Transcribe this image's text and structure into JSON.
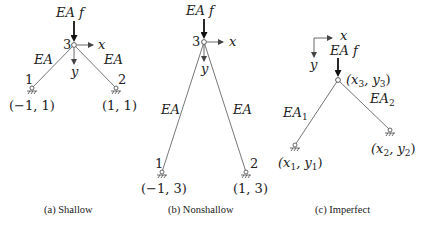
{
  "figure": {
    "panels": [
      {
        "id": "a",
        "caption": "(a) Shallow",
        "load_label": "EA f",
        "free_node_label": "3",
        "axis_x_label": "x",
        "axis_y_label": "y",
        "bar_left_label": "EA",
        "bar_right_label": "EA",
        "node_left_label": "1",
        "node_right_label": "2",
        "node_left_coord": "(−1, 1)",
        "node_right_coord": "(1, 1)"
      },
      {
        "id": "b",
        "caption": "(b) Nonshallow",
        "load_label": "EA f",
        "free_node_label": "3",
        "axis_x_label": "x",
        "axis_y_label": "y",
        "bar_left_label": "EA",
        "bar_right_label": "EA",
        "node_left_label": "1",
        "node_right_label": "2",
        "node_left_coord": "(−1, 3)",
        "node_right_coord": "(1, 3)"
      },
      {
        "id": "c",
        "caption": "(c) Imperfect",
        "load_label": "EA f",
        "free_node_coord": "(x3, y3)",
        "axis_x_label": "x",
        "axis_y_label": "y",
        "bar_left_label": "EA1",
        "bar_right_label": "EA2",
        "node_left_coord": "(x1, y1)",
        "node_right_coord": "(x2, y2)"
      }
    ]
  },
  "colors": {
    "bar": "#777777",
    "text": "#222222",
    "background": "#ffffff"
  }
}
